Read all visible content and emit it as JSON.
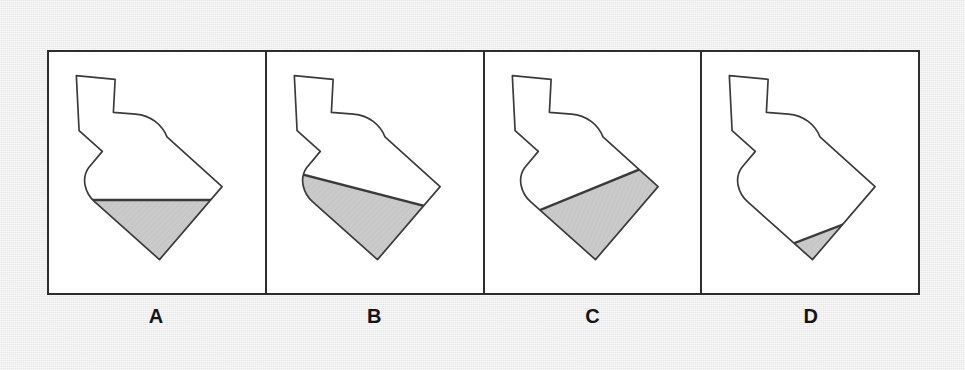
{
  "figure": {
    "background_color": "#ececed",
    "frame_color": "#2d2d2d",
    "panel_background": "#ffffff",
    "bottle_outline_color": "#3a3a3a",
    "liquid_fill_color": "#c8c8c8",
    "liquid_outline_color": "#3a3a3a"
  },
  "panels": [
    {
      "id": "A",
      "label": "A",
      "bottle_tilt_degrees": -22,
      "liquid_surface": "horizontal",
      "liquid_surface_description": "Water surface drawn level (horizontal) with respect to the page.",
      "fill_fraction": 0.33
    },
    {
      "id": "B",
      "label": "B",
      "bottle_tilt_degrees": -22,
      "liquid_surface": "diagonal-down-right",
      "liquid_surface_description": "Water surface drawn as a steep diagonal sloping down from the upper-left shoulder toward the lower-right side.",
      "fill_fraction": 0.55
    },
    {
      "id": "C",
      "label": "C",
      "bottle_tilt_degrees": -22,
      "liquid_surface": "perpendicular-to-bottle-axis",
      "liquid_surface_description": "Water surface drawn perpendicular to the bottle axis, i.e. parallel to the bottle base and tilted with the bottle.",
      "fill_fraction": 0.35
    },
    {
      "id": "D",
      "label": "D",
      "bottle_tilt_degrees": -22,
      "liquid_surface": "diagonal-down-left",
      "liquid_surface_description": "Water surface drawn sloping down toward the lower-left, tilted further than the bottle base.",
      "fill_fraction": 0.26
    }
  ]
}
